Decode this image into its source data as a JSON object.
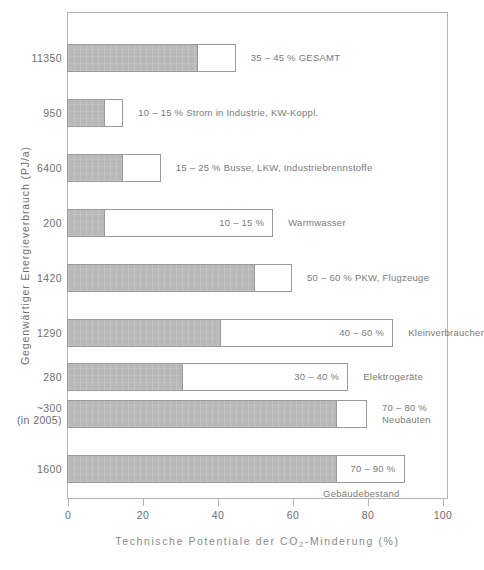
{
  "chart_data": {
    "type": "bar",
    "title": "",
    "xlabel": "Technische Potentiale der CO2-Minderung (%)",
    "xlabel_prefix": "Technische Potentiale der CO",
    "xlabel_sub": "2",
    "xlabel_suffix": "-Minderung (%)",
    "ylabel": "Gegenwärtiger Energieverbrauch (PJ/a)",
    "xlim": [
      0,
      100
    ],
    "xticks": [
      0,
      20,
      40,
      60,
      80,
      100
    ],
    "xtick_labels": [
      "0",
      "20",
      "40",
      "60",
      "80",
      "100"
    ],
    "grid": false,
    "legend": "none",
    "orientation": "horizontal",
    "note": "Each bar shows a filled (gray) low-end value and an open (white outline) high-end value of the technical CO2 reduction potential range.",
    "bars": [
      {
        "category_label": "11350",
        "category_sublabel": "",
        "low": 35,
        "high": 45,
        "range_text": "35 – 45 %",
        "sector_text": "GESAMT",
        "annotation": "35 – 45 % GESAMT",
        "annotation_placement": "right",
        "annotation_line2": ""
      },
      {
        "category_label": "950",
        "category_sublabel": "",
        "low": 10,
        "high": 15,
        "range_text": "10 – 15 %",
        "sector_text": "Strom in Industrie, KW-Koppl.",
        "annotation": "10 – 15 % Strom in Industrie, KW-Koppl.",
        "annotation_placement": "right",
        "annotation_line2": ""
      },
      {
        "category_label": "6400",
        "category_sublabel": "",
        "low": 15,
        "high": 25,
        "range_text": "15 – 25 %",
        "sector_text": "Busse, LKW, Industriebrennstoffe",
        "annotation": "15 – 25 % Busse, LKW, Industriebrennstoffe",
        "annotation_placement": "right",
        "annotation_line2": ""
      },
      {
        "category_label": "200",
        "category_sublabel": "",
        "low": 10,
        "high": 55,
        "range_text": "10 – 15 %",
        "sector_text": "Warmwasser",
        "annotation": "10 – 15 %",
        "annotation_placement": "inside-right",
        "annotation_line2": ""
      },
      {
        "category_label": "1420",
        "category_sublabel": "",
        "low": 50,
        "high": 60,
        "range_text": "50 – 60 %",
        "sector_text": "PKW, Flugzeuge",
        "annotation": "50 – 60 % PKW, Flugzeuge",
        "annotation_placement": "right",
        "annotation_line2": ""
      },
      {
        "category_label": "1290",
        "category_sublabel": "",
        "low": 41,
        "high": 87,
        "range_text": "40 – 60 %",
        "sector_text": "Kleinverbraucher",
        "annotation": "40 – 60 %",
        "annotation_placement": "inside-right",
        "annotation_line2": ""
      },
      {
        "category_label": "280",
        "category_sublabel": "",
        "low": 31,
        "high": 75,
        "range_text": "30 – 40 %",
        "sector_text": "Elektrogeräte",
        "annotation": "30 – 40 %",
        "annotation_placement": "inside-right",
        "annotation_line2": ""
      },
      {
        "category_label": "~300",
        "category_sublabel": "(in 2005)",
        "low": 72,
        "high": 80,
        "range_text": "70 – 80 %",
        "sector_text": "Neubauten",
        "annotation": "70 – 80 %",
        "annotation_placement": "right",
        "annotation_line2": "Neubauten"
      },
      {
        "category_label": "1600",
        "category_sublabel": "",
        "low": 72,
        "high": 90,
        "range_text": "70 – 90 %",
        "sector_text": "Gebäudebestand",
        "annotation": "70 – 90 %",
        "annotation_placement": "inside-right",
        "annotation_line2": "Gebäudebestand"
      }
    ]
  },
  "colors": {
    "bar_fill": "#b8b8b8",
    "bar_stroke": "#9a9a9a",
    "frame": "#b4b4b4",
    "text": "#6e6e6e",
    "annotation_text": "#7a7a7a"
  }
}
